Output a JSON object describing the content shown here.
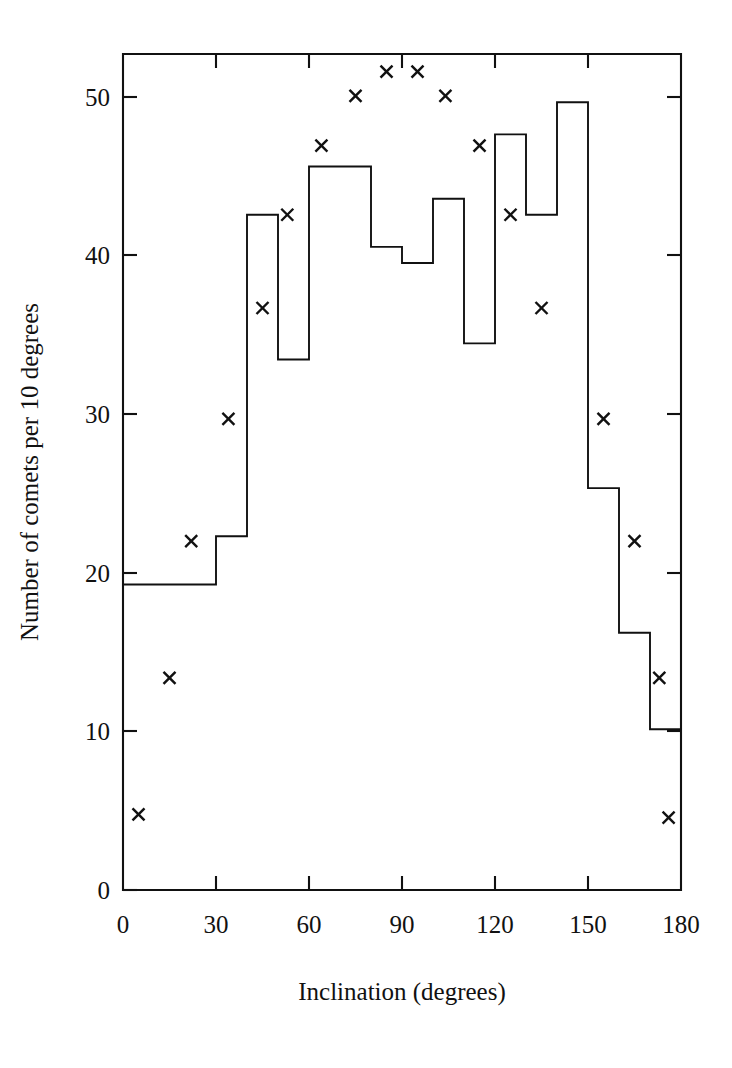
{
  "chart_data": {
    "type": "bar",
    "title": "",
    "subtitle": "",
    "xlabel": "Inclination (degrees)",
    "ylabel": "Number of comets per 10 degrees",
    "xlim": [
      0,
      180
    ],
    "ylim": [
      0,
      52
    ],
    "xticks": [
      0,
      30,
      60,
      90,
      120,
      150,
      180
    ],
    "xtick_labels": [
      "0",
      "30",
      "60",
      "90",
      "120",
      "150",
      "180"
    ],
    "yticks": [
      0,
      10,
      20,
      30,
      40,
      50
    ],
    "ytick_labels": [
      "0",
      "10",
      "20",
      "30",
      "40",
      "50"
    ],
    "grid": false,
    "legend": null,
    "bin_width": 10,
    "categories": [
      "0-10",
      "10-20",
      "20-30",
      "30-40",
      "40-50",
      "50-60",
      "60-70",
      "70-80",
      "80-90",
      "90-100",
      "100-110",
      "110-120",
      "120-130",
      "130-140",
      "140-150",
      "150-160",
      "160-170",
      "170-180"
    ],
    "bin_edges": [
      0,
      10,
      20,
      30,
      40,
      50,
      60,
      70,
      80,
      90,
      100,
      110,
      120,
      130,
      140,
      150,
      160,
      170,
      180
    ],
    "values": [
      19,
      19,
      19,
      22,
      42,
      33,
      45,
      45,
      40,
      39,
      43,
      34,
      47,
      42,
      49,
      25,
      16,
      10
    ],
    "series": [
      {
        "name": "Observed histogram",
        "type": "step",
        "values": [
          19,
          19,
          19,
          22,
          42,
          33,
          45,
          45,
          40,
          39,
          43,
          34,
          47,
          42,
          49,
          25,
          16,
          10
        ]
      },
      {
        "name": "Model points",
        "type": "scatter",
        "marker": "x",
        "points": [
          {
            "x": 5,
            "y": 4.7
          },
          {
            "x": 15,
            "y": 13.2
          },
          {
            "x": 22,
            "y": 21.7
          },
          {
            "x": 34,
            "y": 29.3
          },
          {
            "x": 45,
            "y": 36.2
          },
          {
            "x": 53,
            "y": 42.0
          },
          {
            "x": 64,
            "y": 46.3
          },
          {
            "x": 75,
            "y": 49.4
          },
          {
            "x": 85,
            "y": 50.9
          },
          {
            "x": 95,
            "y": 50.9
          },
          {
            "x": 104,
            "y": 49.4
          },
          {
            "x": 115,
            "y": 46.3
          },
          {
            "x": 125,
            "y": 42.0
          },
          {
            "x": 135,
            "y": 36.2
          },
          {
            "x": 155,
            "y": 29.3
          },
          {
            "x": 165,
            "y": 21.7
          },
          {
            "x": 173,
            "y": 13.2
          },
          {
            "x": 176,
            "y": 4.5
          }
        ]
      }
    ],
    "colors": {
      "line": "#111111",
      "marker": "#111111",
      "background": "#ffffff"
    }
  },
  "axes": {
    "x_title": "Inclination (degrees)",
    "y_title": "Number of comets per 10 degrees"
  }
}
